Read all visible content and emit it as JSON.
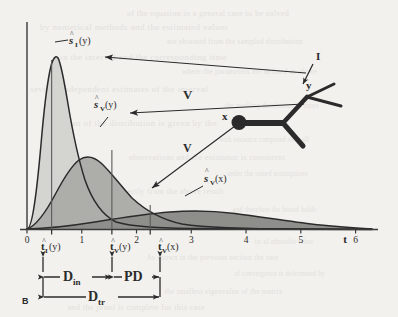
{
  "figure": {
    "panel_label": "B",
    "axis": {
      "x_label": "t",
      "x_ticks": [
        "0",
        "1",
        "2",
        "3",
        "4",
        "5",
        "6"
      ],
      "x_tick_values": [
        0,
        1,
        2,
        3,
        4,
        5,
        6
      ],
      "x_min": 0,
      "x_max": 6.3
    },
    "curve_labels": {
      "s_I_y": "ŝⁱ(y)",
      "s_V_y": "ŝᵥ(y)",
      "s_V_x": "ŝᵥ(x)"
    },
    "marker_labels": {
      "t_I_y": "t̂ⁱ(y)",
      "t_V_y": "t̂ᵥ(y)",
      "t_V_x": "t̂ᵥ(x)"
    },
    "marker_positions": [
      0.45,
      1.55,
      2.25
    ],
    "brackets": {
      "d_in": "D",
      "d_in_sub": "in",
      "pd": "PD",
      "d_tr": "D",
      "d_tr_sub": "tr"
    },
    "tree": {
      "node_x_label": "x",
      "node_y_label": "y",
      "branch_label": "I",
      "arrow_label_upper": "V",
      "arrow_label_lower": "V"
    },
    "colors": {
      "background": "#f2f1ee",
      "ink": "#2b2b2b",
      "fill_light": "#d2d2cf",
      "fill_mid": "#b6b6b2",
      "fill_dark": "#9a9a96",
      "ghost_text": "#e3e1dc"
    }
  },
  "chart_data": {
    "type": "area",
    "title": "",
    "xlabel": "t",
    "ylabel": "",
    "xlim": [
      0,
      6.3
    ],
    "ylim": [
      0,
      1.05
    ],
    "grid": false,
    "legend": "inline-annotations",
    "series": [
      {
        "name": "ŝⁱ(y)",
        "peak_t": 0.35,
        "peak_value": 1.0,
        "x": [
          0,
          0.1,
          0.2,
          0.3,
          0.35,
          0.45,
          0.6,
          0.8,
          1.0,
          1.25,
          1.5,
          1.8,
          2.1,
          2.5,
          3.0,
          3.6,
          4.3,
          5.0,
          6.0,
          6.3
        ],
        "y": [
          0.0,
          0.52,
          0.88,
          0.99,
          1.0,
          0.95,
          0.78,
          0.54,
          0.36,
          0.21,
          0.12,
          0.06,
          0.032,
          0.015,
          0.006,
          0.003,
          0.0015,
          0.001,
          0.0005,
          0.0
        ]
      },
      {
        "name": "ŝᵥ(y)",
        "peak_t": 0.78,
        "peak_value": 0.58,
        "x": [
          0,
          0.1,
          0.25,
          0.45,
          0.6,
          0.78,
          0.95,
          1.2,
          1.5,
          1.8,
          2.2,
          2.6,
          3.1,
          3.7,
          4.3,
          5.0,
          5.6,
          6.0,
          6.3
        ],
        "y": [
          0.0,
          0.12,
          0.3,
          0.48,
          0.55,
          0.58,
          0.565,
          0.5,
          0.4,
          0.31,
          0.215,
          0.15,
          0.095,
          0.055,
          0.033,
          0.018,
          0.011,
          0.008,
          0.006
        ]
      },
      {
        "name": "ŝᵥ(x)",
        "peak_t": 2.2,
        "peak_value": 0.085,
        "x": [
          0,
          0.2,
          0.5,
          0.9,
          1.3,
          1.7,
          2.0,
          2.2,
          2.5,
          2.9,
          3.3,
          3.8,
          4.3,
          4.9,
          5.5,
          6.0,
          6.3
        ],
        "y": [
          0.0,
          0.006,
          0.018,
          0.038,
          0.058,
          0.075,
          0.083,
          0.085,
          0.082,
          0.073,
          0.061,
          0.046,
          0.033,
          0.021,
          0.013,
          0.009,
          0.007
        ]
      }
    ],
    "markers": [
      {
        "label": "t̂ⁱ(y)",
        "t": 0.45
      },
      {
        "label": "t̂ᵥ(y)",
        "t": 1.55
      },
      {
        "label": "t̂ᵥ(x)",
        "t": 2.25
      }
    ],
    "spans": [
      {
        "label": "D_in",
        "from": 0.45,
        "to": 1.55
      },
      {
        "label": "PD",
        "from": 1.55,
        "to": 2.25
      },
      {
        "label": "D_tr",
        "from": 0.45,
        "to": 2.25
      }
    ]
  },
  "ghost_lines": [
    {
      "x": 118,
      "y": 8,
      "w": 0.9,
      "text": "of the equation in a general case to be solved"
    },
    {
      "x": 40,
      "y": 22,
      "w": 1.0,
      "text": "by numerical methods and the estimated values"
    },
    {
      "x": 150,
      "y": 36,
      "w": 0.8,
      "text": "are obtained from the sampled distribution"
    },
    {
      "x": 60,
      "y": 52,
      "w": 1.0,
      "text": "in the interval and the corresponding time"
    },
    {
      "x": 165,
      "y": 66,
      "w": 0.8,
      "text": "where the parameters are defined as above"
    },
    {
      "x": 30,
      "y": 84,
      "w": 1.0,
      "text": "several independent estimates of the interval"
    },
    {
      "x": 205,
      "y": 100,
      "w": 0.7,
      "text": "the resulting distribution of times"
    },
    {
      "x": 45,
      "y": 118,
      "w": 1.0,
      "text": "the mean of the distribution is given by the"
    },
    {
      "x": 200,
      "y": 134,
      "w": 0.7,
      "text": "with variance computed over all"
    },
    {
      "x": 120,
      "y": 152,
      "w": 0.9,
      "text": "observations and the estimator is consistent"
    },
    {
      "x": 210,
      "y": 168,
      "w": 0.7,
      "text": "under the stated assumptions"
    },
    {
      "x": 55,
      "y": 186,
      "w": 0.9,
      "text": "which follows directly from the above result"
    },
    {
      "x": 215,
      "y": 204,
      "w": 0.7,
      "text": "and therefore the bound holds"
    },
    {
      "x": 235,
      "y": 236,
      "w": 0.6,
      "text": "for all admissible values"
    },
    {
      "x": 130,
      "y": 252,
      "w": 0.8,
      "text": "As shown in the previous section the rate"
    },
    {
      "x": 215,
      "y": 268,
      "w": 0.7,
      "text": "of convergence is determined by"
    },
    {
      "x": 150,
      "y": 286,
      "w": 0.8,
      "text": "the smallest eigenvalue of the matrix"
    },
    {
      "x": 60,
      "y": 302,
      "w": 0.9,
      "text": "and the proof is complete for this case"
    }
  ]
}
